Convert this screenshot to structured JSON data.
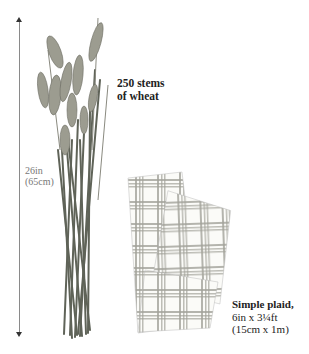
{
  "measurement": {
    "height_in": "26in",
    "height_cm": "(65cm)"
  },
  "items": [
    {
      "id": "wheat",
      "label_line1": "250 stems",
      "label_line2": "of wheat"
    },
    {
      "id": "plaid",
      "label_line1": "Simple plaid,",
      "label_line2": "6in x 3¼ft",
      "label_line3": "(15cm x 1m)"
    }
  ],
  "colors": {
    "background": "#ffffff",
    "wheat": "#8c8c80",
    "stem": "#5f6358",
    "plaid_stripe": "#9a9a92",
    "text": "#222222"
  }
}
